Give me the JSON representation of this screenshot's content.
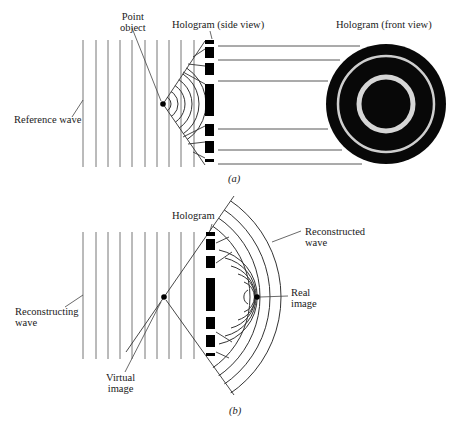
{
  "panel_a": {
    "caption": "(a)",
    "labels": {
      "point_object_line1": "Point",
      "point_object_line2": "object",
      "hologram_side": "Hologram (side view)",
      "hologram_front": "Hologram (front view)",
      "reference_wave": "Reference wave"
    }
  },
  "panel_b": {
    "caption": "(b)",
    "labels": {
      "hologram": "Hologram",
      "reconstructed_line1": "Reconstructed",
      "reconstructed_line2": "wave",
      "real_line1": "Real",
      "real_line2": "image",
      "reconstructing_line1": "Reconstructing",
      "reconstructing_line2": "wave",
      "virtual_line1": "Virtual",
      "virtual_line2": "image"
    }
  },
  "colors": {
    "ink": "#111111",
    "line": "#555555",
    "background": "#ffffff"
  }
}
